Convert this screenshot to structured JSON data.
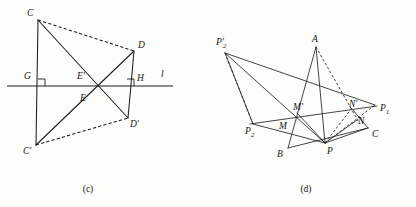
{
  "page": {
    "background_color": "#fdfdfb",
    "ink_color": "#1c1c1c",
    "width": 416,
    "height": 207
  },
  "figures": [
    {
      "id": "fig-c",
      "caption": "(c)",
      "caption_pos": {
        "x": 88,
        "y": 191
      },
      "description": "Reflection of triangle CDE across line l producing C'D'E'",
      "line_label": "l",
      "line_label_pos": {
        "x": 163,
        "y": 76
      },
      "axis_line": {
        "x1": 7,
        "y1": 86,
        "x2": 173,
        "y2": 86
      },
      "points": [
        {
          "name": "C",
          "label": "C",
          "x": 38,
          "y": 20,
          "lx": 27,
          "ly": 16
        },
        {
          "name": "D",
          "label": "D",
          "x": 134,
          "y": 51,
          "lx": 138,
          "ly": 48
        },
        {
          "name": "G",
          "label": "G",
          "x": 38,
          "y": 86,
          "lx": 24,
          "ly": 79
        },
        {
          "name": "H",
          "label": "H",
          "x": 134,
          "y": 86,
          "lx": 137,
          "ly": 81
        },
        {
          "name": "Eprime",
          "label": "E'",
          "x": 84,
          "y": 86,
          "lx": 79,
          "ly": 79
        },
        {
          "name": "E",
          "label": "E",
          "x": 84,
          "y": 86,
          "lx": 81,
          "ly": 100
        },
        {
          "name": "Cprime",
          "label": "C'",
          "x": 36,
          "y": 145,
          "lx": 25,
          "ly": 153
        },
        {
          "name": "Dprime",
          "label": "D'",
          "x": 128,
          "y": 118,
          "lx": 131,
          "ly": 126
        }
      ],
      "solid_segments": [
        {
          "from": "C",
          "to": "Cprime",
          "note": "vertical left side through G"
        },
        {
          "from": "D",
          "to": "Dprime",
          "note": "vertical right side through H"
        },
        {
          "from": "C",
          "to": "Dprime",
          "note": "diagonal C to D'"
        },
        {
          "from": "Cprime",
          "to": "D",
          "note": "diagonal C' to D"
        }
      ],
      "dashed_segments": [
        {
          "from": "C",
          "to": "D",
          "note": "top dashed edge"
        },
        {
          "from": "Cprime",
          "to": "Dprime",
          "note": "bottom dashed edge"
        }
      ],
      "right_angle_marks": [
        {
          "at": "G",
          "x": 38,
          "y": 86,
          "size": 7,
          "dir": "right-up"
        },
        {
          "at": "H",
          "x": 134,
          "y": 86,
          "size": 7,
          "dir": "left-up"
        }
      ]
    },
    {
      "id": "fig-d",
      "caption": "(d)",
      "caption_pos": {
        "x": 306,
        "y": 191
      },
      "description": "Triangle ABC with reflected points P1, P2, P2' and intersection points M, M', N, N'",
      "points": [
        {
          "name": "P2prime",
          "label": "P'",
          "sub": "2",
          "x": 225,
          "y": 53,
          "lx": 218,
          "ly": 44
        },
        {
          "name": "A",
          "label": "A",
          "sub": "",
          "x": 316,
          "y": 47,
          "lx": 312,
          "ly": 42
        },
        {
          "name": "P1",
          "label": "P",
          "sub": "1",
          "x": 375,
          "y": 105,
          "lx": 380,
          "ly": 112
        },
        {
          "name": "Nprime",
          "label": "N'",
          "sub": "",
          "x": 353,
          "y": 110,
          "lx": 352,
          "ly": 106
        },
        {
          "name": "N",
          "label": "N",
          "sub": "",
          "x": 357,
          "y": 120,
          "lx": 359,
          "ly": 122
        },
        {
          "name": "Mprime",
          "label": "M'",
          "sub": "",
          "x": 297,
          "y": 113,
          "lx": 297,
          "ly": 109
        },
        {
          "name": "M",
          "label": "M",
          "sub": "",
          "x": 286,
          "y": 126,
          "lx": 281,
          "ly": 127
        },
        {
          "name": "P2",
          "label": "P",
          "sub": "2",
          "x": 253,
          "y": 124,
          "lx": 247,
          "ly": 133
        },
        {
          "name": "B",
          "label": "B",
          "sub": "",
          "x": 288,
          "y": 148,
          "lx": 279,
          "ly": 156
        },
        {
          "name": "P",
          "label": "P",
          "sub": "",
          "x": 325,
          "y": 143,
          "lx": 328,
          "ly": 153
        },
        {
          "name": "C",
          "label": "C",
          "sub": "",
          "x": 368,
          "y": 128,
          "lx": 373,
          "ly": 136
        }
      ],
      "solid_segments": [
        {
          "from": "P2prime",
          "to": "P1",
          "note": "long upper ray"
        },
        {
          "from": "P2prime",
          "to": "P",
          "note": "ray to P"
        },
        {
          "from": "P2prime",
          "to": "P2",
          "note": "short ray to P2"
        },
        {
          "from": "P2",
          "to": "P1",
          "note": "lower long chord"
        },
        {
          "from": "A",
          "to": "B",
          "note": "triangle side AB"
        },
        {
          "from": "A",
          "to": "P",
          "note": "segment A to P"
        },
        {
          "from": "B",
          "to": "C",
          "note": "triangle base BC"
        },
        {
          "from": "P",
          "to": "N",
          "note": "segment P to N"
        },
        {
          "from": "P",
          "to": "Mprime",
          "note": "segment P to M'"
        },
        {
          "from": "P",
          "to": "C",
          "note": "segment P to C"
        },
        {
          "from": "Nprime",
          "to": "C",
          "note": "segment N' to C"
        }
      ],
      "dashed_segments": [
        {
          "from": "A",
          "to": "N",
          "note": "dashed from A down through N'"
        },
        {
          "from": "P2",
          "to": "P2prime",
          "note": "dashed left edge"
        },
        {
          "from": "P",
          "to": "P1",
          "note": "dashed P to P1"
        },
        {
          "from": "P",
          "to": "Nprime",
          "note": "dashed P to N'"
        }
      ]
    }
  ]
}
